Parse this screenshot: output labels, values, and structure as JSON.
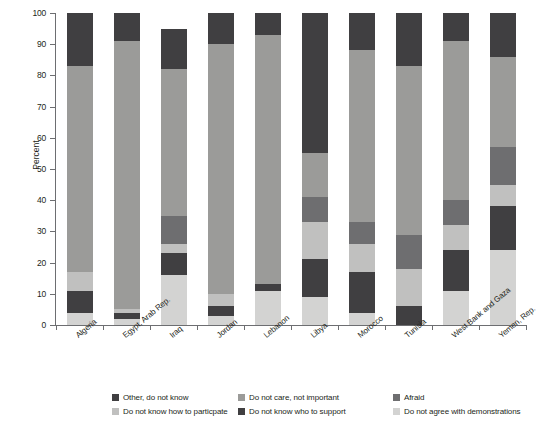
{
  "chart_data": {
    "type": "bar",
    "subtype": "stacked-column-100",
    "title": "",
    "xlabel": "",
    "ylabel": "Percent",
    "ylim": [
      0,
      100
    ],
    "yticks": [
      0,
      10,
      20,
      30,
      40,
      50,
      60,
      70,
      80,
      90,
      100
    ],
    "grid": false,
    "legend_position": "bottom",
    "categories": [
      "Algeria",
      "Egypt, Arab Rep.",
      "Iraq",
      "Jordan",
      "Lebanon",
      "Libya",
      "Morocco",
      "Tunisia",
      "West Bank and Gaza",
      "Yemen, Rep."
    ],
    "series": [
      {
        "name": "Do not agree with demonstrations",
        "color": "#d3d3d2",
        "values": [
          4,
          2,
          16,
          3,
          11,
          9,
          4,
          0,
          11,
          24
        ]
      },
      {
        "name": "Do not know who to support",
        "color": "#403f41",
        "values": [
          7,
          2,
          7,
          3,
          2,
          12,
          13,
          6,
          13,
          14
        ]
      },
      {
        "name": "Do not know how to particpate",
        "color": "#c0c0bf",
        "values": [
          6,
          1,
          3,
          4,
          0,
          12,
          9,
          12,
          8,
          7
        ]
      },
      {
        "name": "Afraid",
        "color": "#6e6e70",
        "values": [
          0,
          0,
          9,
          0,
          0,
          8,
          7,
          11,
          8,
          12
        ]
      },
      {
        "name": "Do not care, not important",
        "color": "#9b9b99",
        "values": [
          66,
          86,
          47,
          80,
          80,
          14,
          55,
          54,
          51,
          29
        ]
      },
      {
        "name": "Other, do not know",
        "color": "#403f41",
        "values": [
          17,
          9,
          13,
          10,
          7,
          45,
          12,
          17,
          9,
          14
        ]
      }
    ],
    "legend_entries": [
      {
        "label": "Other, do not know",
        "color": "#403f41"
      },
      {
        "label": "Do not care, not important",
        "color": "#9b9b99"
      },
      {
        "label": "Afraid",
        "color": "#6e6e70"
      },
      {
        "label": "Do not know how to particpate",
        "color": "#c0c0bf"
      },
      {
        "label": "Do not know who to support",
        "color": "#403f41"
      },
      {
        "label": "Do not agree with demonstrations",
        "color": "#d3d3d2"
      }
    ]
  }
}
